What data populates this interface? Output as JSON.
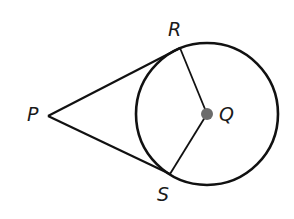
{
  "diagram": {
    "colors": {
      "stroke": "#111111",
      "center_point": "#6b6b6b",
      "background": "#ffffff"
    },
    "circle": {
      "center": "Q",
      "cx": 207,
      "cy": 114,
      "r": 71
    },
    "points": {
      "P": {
        "label": "P",
        "x": 48,
        "y": 116
      },
      "Q": {
        "label": "Q",
        "x": 207,
        "y": 114
      },
      "R": {
        "label": "R",
        "x": 180,
        "y": 48
      },
      "S": {
        "label": "S",
        "x": 170,
        "y": 174
      }
    },
    "segments": [
      {
        "from": "P",
        "to": "R",
        "type": "tangent"
      },
      {
        "from": "P",
        "to": "S",
        "type": "tangent"
      },
      {
        "from": "Q",
        "to": "R",
        "type": "radius"
      },
      {
        "from": "Q",
        "to": "S",
        "type": "radius"
      }
    ],
    "labels": {
      "P": "P",
      "Q": "Q",
      "R": "R",
      "S": "S"
    }
  }
}
